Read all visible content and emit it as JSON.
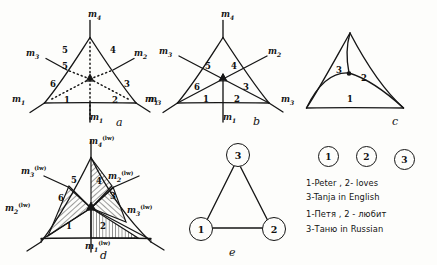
{
  "figure": {
    "panel_letters": [
      "a",
      "b",
      "c",
      "d",
      "e"
    ]
  },
  "panel_a": {
    "letter": "a",
    "mass_labels": [
      {
        "base": "m",
        "sub": "4",
        "sup": "",
        "pos": "top"
      },
      {
        "base": "m",
        "sub": "3",
        "sup": "",
        "pos": "upper-left"
      },
      {
        "base": "m",
        "sub": "2",
        "sup": "",
        "pos": "upper-right"
      },
      {
        "base": "m",
        "sub": "1",
        "sup": "",
        "pos": "lower-left"
      },
      {
        "base": "m",
        "sub": "3",
        "sup": "",
        "pos": "lower-right"
      },
      {
        "base": "m",
        "sub": "1",
        "sup": "",
        "pos": "bottom"
      }
    ],
    "sector_numbers": [
      "1",
      "2",
      "3",
      "4",
      "5",
      "6"
    ],
    "edge_numbers": [
      "5",
      "4"
    ]
  },
  "panel_b": {
    "letter": "b",
    "mass_labels": [
      {
        "base": "m",
        "sub": "4",
        "sup": "",
        "pos": "top"
      },
      {
        "base": "m",
        "sub": "3",
        "sup": "",
        "pos": "upper-left"
      },
      {
        "base": "m",
        "sub": "2",
        "sup": "",
        "pos": "upper-right"
      },
      {
        "base": "m",
        "sub": "1",
        "sup": "",
        "pos": "lower-left"
      },
      {
        "base": "m",
        "sub": "3",
        "sup": "",
        "pos": "lower-right"
      },
      {
        "base": "m",
        "sub": "1",
        "sup": "",
        "pos": "bottom"
      }
    ],
    "sector_numbers": [
      "1",
      "2",
      "3",
      "4",
      "5",
      "6"
    ]
  },
  "panel_c": {
    "letter": "c",
    "region_numbers": [
      "1",
      "2",
      "3"
    ]
  },
  "panel_d": {
    "letter": "d",
    "mass_labels": [
      {
        "base": "m",
        "sub": "4",
        "sup": "(lw)",
        "pos": "top"
      },
      {
        "base": "m",
        "sub": "3",
        "sup": "(lw)",
        "pos": "upper-left"
      },
      {
        "base": "m",
        "sub": "2",
        "sup": "(lw)",
        "pos": "upper-right"
      },
      {
        "base": "m",
        "sub": "2",
        "sup": "(lw)",
        "pos": "lower-left"
      },
      {
        "base": "m",
        "sub": "3",
        "sup": "(lw)",
        "pos": "lower-right"
      },
      {
        "base": "m",
        "sub": "1",
        "sup": "(lw)",
        "pos": "bottom"
      }
    ],
    "sector_numbers": [
      "1",
      "2",
      "3",
      "4",
      "5",
      "6"
    ],
    "hatched_sectors": [
      "2",
      "3",
      "5",
      "6"
    ]
  },
  "panel_e": {
    "letter": "e",
    "nodes": [
      "1",
      "2",
      "3"
    ]
  },
  "legend": {
    "circled_numbers": [
      "1",
      "2",
      "3"
    ],
    "lines": [
      "1-Peter , 2- loves",
      "3-Tanja  in English",
      "1-Петя , 2 - любит",
      "3-Таню  in Russian"
    ]
  }
}
